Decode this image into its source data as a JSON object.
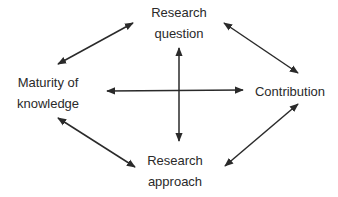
{
  "nodes": {
    "research_question": {
      "line1": "Research",
      "line2": "question"
    },
    "maturity": {
      "line1": "Maturity of",
      "line2": "knowledge"
    },
    "contribution": {
      "label": "Contribution"
    },
    "research_approach": {
      "line1": "Research",
      "line2": "approach"
    }
  },
  "edges": [
    {
      "from": "maturity",
      "to": "research_question",
      "type": "bidirectional"
    },
    {
      "from": "research_question",
      "to": "contribution",
      "type": "bidirectional"
    },
    {
      "from": "maturity",
      "to": "research_approach",
      "type": "bidirectional"
    },
    {
      "from": "research_approach",
      "to": "contribution",
      "type": "bidirectional"
    },
    {
      "from": "maturity",
      "to": "contribution",
      "type": "bidirectional"
    },
    {
      "from": "research_question",
      "to": "research_approach",
      "type": "bidirectional"
    }
  ],
  "colors": {
    "arrow": "#2a2a2a",
    "text": "#2a2a2a"
  }
}
